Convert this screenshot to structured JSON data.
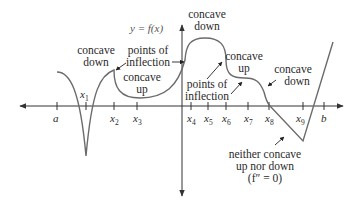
{
  "figure": {
    "function_label": "y = f(x)",
    "colors": {
      "axis": "#333333",
      "curve": "#6b6b6b",
      "text": "#2a2a2a",
      "function_label": "#555555"
    },
    "x_axis_ticks": [
      {
        "name": "a",
        "label": "a",
        "sub": ""
      },
      {
        "name": "x1",
        "label": "x",
        "sub": "1"
      },
      {
        "name": "x2",
        "label": "x",
        "sub": "2"
      },
      {
        "name": "x3",
        "label": "x",
        "sub": "3"
      },
      {
        "name": "x4",
        "label": "x",
        "sub": "4"
      },
      {
        "name": "x5",
        "label": "x",
        "sub": "5"
      },
      {
        "name": "x6",
        "label": "x",
        "sub": "6"
      },
      {
        "name": "x7",
        "label": "x",
        "sub": "7"
      },
      {
        "name": "x8",
        "label": "x",
        "sub": "8"
      },
      {
        "name": "x9",
        "label": "x",
        "sub": "9"
      },
      {
        "name": "b",
        "label": "b",
        "sub": ""
      }
    ],
    "annotations": {
      "concave_down_left": [
        "concave",
        "down"
      ],
      "points_of_inflection_top": [
        "points of",
        "inflection"
      ],
      "concave_up_left": [
        "concave",
        "up"
      ],
      "concave_down_top": [
        "concave",
        "down"
      ],
      "concave_up_right": [
        "concave",
        "up"
      ],
      "points_of_inflection_bottom": [
        "points of",
        "inflection"
      ],
      "concave_down_right": [
        "concave",
        "down"
      ],
      "neither": [
        "neither concave",
        "up nor down",
        "(f″ = 0)"
      ]
    }
  }
}
